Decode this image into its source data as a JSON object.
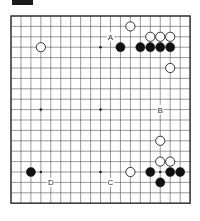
{
  "figure": {
    "tag_color": "#1a1a1a"
  },
  "board": {
    "size": 19,
    "origin_x": 11,
    "origin_y": 16,
    "step_x": 9.95,
    "step_y": 10.4,
    "line_color": "#555555",
    "border_color": "#333333",
    "star_points": [
      [
        3,
        3
      ],
      [
        9,
        3
      ],
      [
        15,
        3
      ],
      [
        3,
        9
      ],
      [
        9,
        9
      ],
      [
        15,
        9
      ],
      [
        3,
        15
      ],
      [
        9,
        15
      ],
      [
        15,
        15
      ]
    ],
    "stones": [
      {
        "color": "white",
        "col": 12,
        "row": 1
      },
      {
        "color": "white",
        "col": 14,
        "row": 2
      },
      {
        "color": "white",
        "col": 15,
        "row": 2
      },
      {
        "color": "white",
        "col": 16,
        "row": 2
      },
      {
        "color": "black",
        "col": 11,
        "row": 3
      },
      {
        "color": "black",
        "col": 13,
        "row": 3
      },
      {
        "color": "black",
        "col": 14,
        "row": 3
      },
      {
        "color": "black",
        "col": 15,
        "row": 3
      },
      {
        "color": "black",
        "col": 16,
        "row": 3
      },
      {
        "color": "white",
        "col": 3,
        "row": 3
      },
      {
        "color": "white",
        "col": 16,
        "row": 5
      },
      {
        "color": "white",
        "col": 15,
        "row": 12
      },
      {
        "color": "white",
        "col": 15,
        "row": 14
      },
      {
        "color": "white",
        "col": 16,
        "row": 14
      },
      {
        "color": "white",
        "col": 12,
        "row": 15
      },
      {
        "color": "black",
        "col": 14,
        "row": 15
      },
      {
        "color": "black",
        "col": 16,
        "row": 15
      },
      {
        "color": "black",
        "col": 17,
        "row": 15
      },
      {
        "color": "black",
        "col": 15,
        "row": 16
      },
      {
        "color": "black",
        "col": 2,
        "row": 15
      }
    ],
    "labels": [
      {
        "text": "A",
        "col": 10,
        "row": 2
      },
      {
        "text": "B",
        "col": 15,
        "row": 9
      },
      {
        "text": "C",
        "col": 10,
        "row": 16
      },
      {
        "text": "D",
        "col": 4,
        "row": 16
      }
    ]
  }
}
